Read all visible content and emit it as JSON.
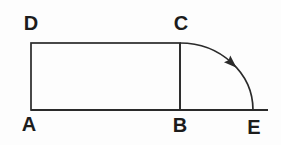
{
  "diagram": {
    "type": "geometric-figure",
    "figure": "Rectangle ABCD with vertical side CB, baseline A-B-E, and a quarter arc from C to E marked with a direction arrow",
    "labels": {
      "a": "A",
      "b": "B",
      "c": "C",
      "d": "D",
      "e": "E"
    },
    "colors": {
      "line": "#2a2a2a",
      "text": "#1c1c1c",
      "background": "#fdfdfd"
    }
  }
}
